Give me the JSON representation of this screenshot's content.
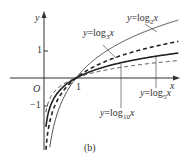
{
  "figure": {
    "caption": "(b)",
    "axes": {
      "x_label": "x",
      "y_label": "y",
      "origin_label": "O",
      "tick_x": "1",
      "tick_y_pos": "1",
      "tick_y_neg": "−1"
    },
    "curves": [
      {
        "name": "log2",
        "label_prefix": "y=log",
        "base": "2",
        "var": "x",
        "style": "thin-solid"
      },
      {
        "name": "log3",
        "label_prefix": "y=log",
        "base": "3",
        "var": "x",
        "style": "bold-dashed"
      },
      {
        "name": "log5",
        "label_prefix": "y=log",
        "base": "5",
        "var": "x",
        "style": "bold-solid"
      },
      {
        "name": "log10",
        "label_prefix": "y=log",
        "base": "10",
        "var": "x",
        "style": "thin-dashed"
      }
    ]
  }
}
